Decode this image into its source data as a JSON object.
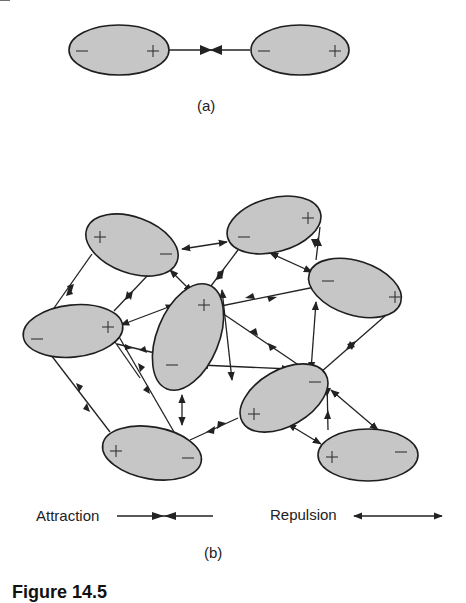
{
  "panel_a": {
    "label": "(a)",
    "molecules": [
      {
        "id": "a1",
        "left_sign": "−",
        "right_sign": "+"
      },
      {
        "id": "a2",
        "left_sign": "−",
        "right_sign": "+"
      }
    ],
    "interaction": "attraction"
  },
  "panel_b": {
    "label": "(b)",
    "molecule_count": 8,
    "description": "Network of dipolar molecules with attractive and repulsive interactions"
  },
  "legend": {
    "attraction_label": "Attraction",
    "repulsion_label": "Repulsion"
  },
  "caption": {
    "text": "Figure 14.5"
  },
  "colors": {
    "molecule_fill": "#c6c6c6",
    "stroke": "#1e1e1e",
    "background": "#ffffff"
  }
}
